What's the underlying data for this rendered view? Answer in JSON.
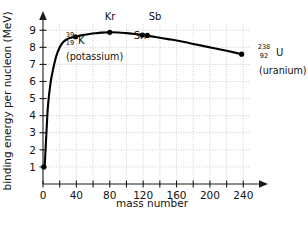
{
  "chart_data": {
    "type": "line",
    "title": "",
    "xlabel": "mass number",
    "ylabel": "binding energy per nucleon (MeV)",
    "xlim": [
      0,
      260
    ],
    "ylim": [
      0,
      9.6
    ],
    "xticks": [
      0,
      40,
      80,
      120,
      160,
      200,
      240
    ],
    "xtick_labels": [
      "0",
      "40",
      "80",
      "120",
      "160",
      "200",
      "240"
    ],
    "x_minor_ticks": [
      20,
      60,
      100,
      140,
      180,
      220
    ],
    "yticks": [
      1,
      2,
      3,
      4,
      5,
      6,
      7,
      8,
      9
    ],
    "ytick_labels": [
      "1",
      "2",
      "3",
      "4",
      "5",
      "6",
      "7",
      "8",
      "9"
    ],
    "grid": true,
    "grid_style": "dotted",
    "legend": "none",
    "series": [
      {
        "name": "binding energy per nucleon",
        "x": [
          1,
          2,
          4,
          6,
          9,
          12,
          16,
          20,
          24,
          28,
          32,
          39,
          46,
          56,
          62,
          70,
          80,
          90,
          100,
          110,
          119,
          130,
          140,
          150,
          160,
          175,
          190,
          205,
          220,
          238
        ],
        "values": [
          1.0,
          1.1,
          2.9,
          4.6,
          5.9,
          6.7,
          7.5,
          8.0,
          8.3,
          8.45,
          8.55,
          8.62,
          8.7,
          8.78,
          8.82,
          8.86,
          8.88,
          8.87,
          8.83,
          8.78,
          8.72,
          8.64,
          8.56,
          8.48,
          8.4,
          8.25,
          8.1,
          7.95,
          7.8,
          7.6
        ]
      }
    ],
    "markers": [
      {
        "name": "potassium-marker",
        "label": "K",
        "x": 39,
        "y": 8.62,
        "mass_number": "39",
        "atomic_number": "19",
        "element_symbol": "K",
        "element_name": "(potassium)",
        "label_style": "isotope"
      },
      {
        "name": "krypton-marker",
        "label": "Kr",
        "x": 80,
        "y": 8.88,
        "label_style": "simple"
      },
      {
        "name": "tin-marker",
        "label": "Sn",
        "x": 119,
        "y": 8.72,
        "label_style": "simple"
      },
      {
        "name": "antimony-marker",
        "label": "Sb",
        "x": 125,
        "y": 8.7,
        "label_style": "simple"
      },
      {
        "name": "uranium-marker",
        "label": "U",
        "x": 238,
        "y": 7.6,
        "mass_number": "238",
        "atomic_number": "92",
        "element_symbol": "U",
        "element_name": "(uranium)",
        "label_style": "isotope"
      }
    ],
    "annotations": {
      "kr_label": "Kr",
      "sb_label": "Sb",
      "sn_label": "Sn",
      "k_mass": "39",
      "k_atomic": "19",
      "k_symbol": "K",
      "k_name": "(potassium)",
      "u_mass": "238",
      "u_atomic": "92",
      "u_symbol": "U",
      "u_name": "(uranium)"
    },
    "colors": {
      "curve": "#000000",
      "axis": "#1a1a1a",
      "grid": "#b9b9b9",
      "background": "#ffffff",
      "text": "#111111"
    }
  }
}
